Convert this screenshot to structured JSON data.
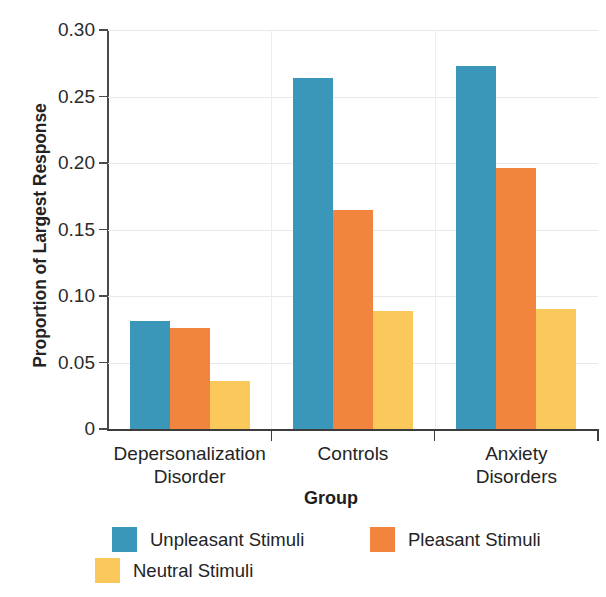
{
  "chart_data": {
    "type": "bar",
    "title": "",
    "xlabel": "Group",
    "ylabel": "Proportion of Largest Response",
    "categories": [
      "Depersonalization Disorder",
      "Controls",
      "Anxiety Disorders"
    ],
    "category_lines": [
      [
        "Depersonalization",
        "Disorder"
      ],
      [
        "Controls",
        ""
      ],
      [
        "Anxiety",
        "Disorders"
      ]
    ],
    "series": [
      {
        "name": "Unpleasant Stimuli",
        "color": "#3b97b9",
        "values": [
          0.081,
          0.264,
          0.273
        ]
      },
      {
        "name": "Pleasant Stimuli",
        "color": "#f2853d",
        "values": [
          0.076,
          0.165,
          0.196
        ]
      },
      {
        "name": "Neutral Stimuli",
        "color": "#fbc85c",
        "values": [
          0.036,
          0.089,
          0.09
        ]
      }
    ],
    "ylim": [
      0,
      0.3
    ],
    "yticks": [
      0,
      0.05,
      0.1,
      0.15,
      0.2,
      0.25,
      0.3
    ],
    "ytick_labels": [
      "0",
      "0.05",
      "0.10",
      "0.15",
      "0.20",
      "0.25",
      "0.30"
    ],
    "grid": "horizontal",
    "legend_position": "bottom-left",
    "legend": [
      "Unpleasant Stimuli",
      "Pleasant Stimuli",
      "Neutral Stimuli"
    ]
  },
  "axis": {
    "y_title": "Proportion of Largest Response",
    "x_title": "Group"
  }
}
